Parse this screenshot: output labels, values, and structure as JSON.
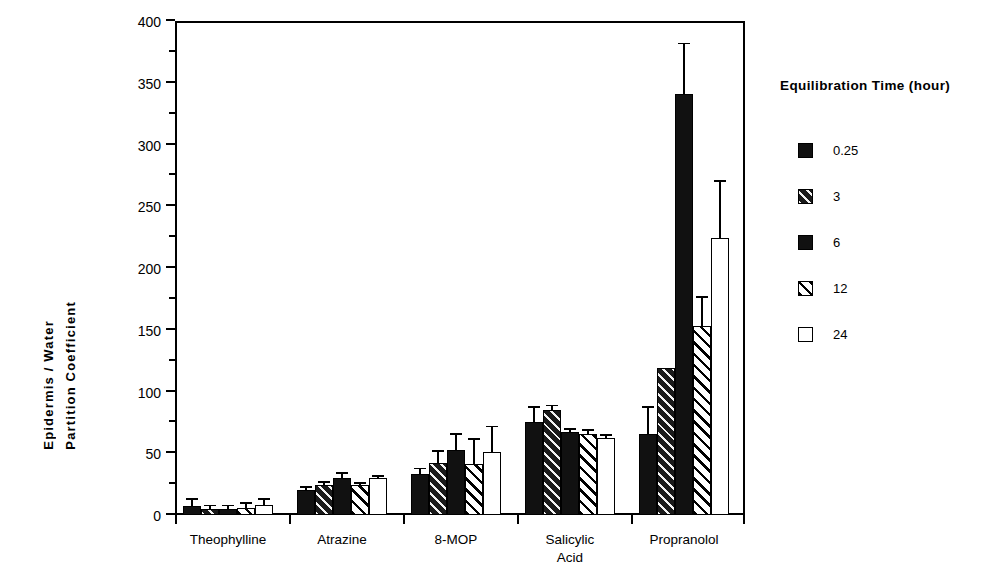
{
  "chart_data": {
    "type": "bar",
    "title": "",
    "xlabel": "",
    "ylabel": "Epidermis / Water Partition Coefficient",
    "ylabel_lines": [
      "Epidermis  /  Water",
      "Partition   Coefficient"
    ],
    "ylim": [
      0,
      400
    ],
    "ytick_step": 50,
    "yminor_step": 25,
    "grid": false,
    "legend_position": "right",
    "legend_title": "Equilibration Time (hour)",
    "categories": [
      "Theophylline",
      "Atrazine",
      "8-MOP",
      "Salicylic\nAcid",
      "Propranolol"
    ],
    "yticks": [
      0,
      50,
      100,
      150,
      200,
      250,
      300,
      350,
      400
    ],
    "ytick_labels": [
      "0",
      "50",
      "100",
      "150",
      "200",
      "250",
      "300",
      "350",
      "400"
    ],
    "series": [
      {
        "name": "0.25",
        "fill": "solid",
        "values": [
          7,
          20,
          33,
          75,
          66
        ],
        "errors": [
          5,
          2,
          4,
          12,
          21
        ]
      },
      {
        "name": "3",
        "fill": "hatch-dark",
        "values": [
          5,
          24,
          42,
          85,
          119
        ],
        "errors": [
          2,
          2,
          9,
          3,
          0
        ]
      },
      {
        "name": "6",
        "fill": "solid",
        "values": [
          5,
          30,
          53,
          67,
          341
        ],
        "errors": [
          2,
          3,
          12,
          2,
          40
        ]
      },
      {
        "name": "12",
        "fill": "hatch-light",
        "values": [
          6,
          24,
          41,
          66,
          153
        ],
        "errors": [
          3,
          1,
          20,
          2,
          23
        ]
      },
      {
        "name": "24",
        "fill": "open",
        "values": [
          8,
          30,
          51,
          62,
          224
        ],
        "errors": [
          4,
          1,
          20,
          2,
          46
        ]
      }
    ]
  },
  "legend": {
    "title": "Equilibration Time (hour)",
    "entries": [
      {
        "label": "0.25",
        "fill": "solid"
      },
      {
        "label": "3",
        "fill": "hatch-dark"
      },
      {
        "label": "6",
        "fill": "solid"
      },
      {
        "label": "12",
        "fill": "hatch-light"
      },
      {
        "label": "24",
        "fill": "open"
      }
    ]
  }
}
